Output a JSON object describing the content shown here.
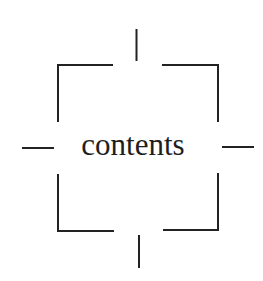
{
  "diagram": {
    "label": "contents",
    "stroke_color": "#222222",
    "text_color": "#1e1e1e",
    "background": "#ffffff"
  }
}
